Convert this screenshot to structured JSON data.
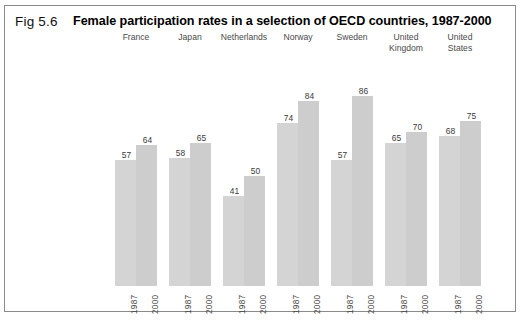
{
  "figure": {
    "number_label": "Fig 5.6",
    "title": "Female participation rates in a selection of OECD countries, 1987-2000",
    "source_note": ""
  },
  "chart_data": {
    "type": "bar",
    "title": "Female participation rates in a selection of OECD countries, 1987-2000",
    "xlabel": "",
    "ylabel": "",
    "ylim": [
      0,
      90
    ],
    "grid": false,
    "legend": "none",
    "categories": [
      "France",
      "Japan",
      "Netherlands",
      "Norway",
      "Sweden",
      "United Kingdom",
      "United States"
    ],
    "series": [
      {
        "name": "1987",
        "values": [
          57,
          58,
          41,
          74,
          57,
          65,
          68
        ]
      },
      {
        "name": "2000",
        "values": [
          64,
          65,
          50,
          84,
          86,
          70,
          75
        ]
      }
    ],
    "groups": [
      {
        "category": "France",
        "label_lines": "France",
        "bars": [
          {
            "year": "1987",
            "value": 57
          },
          {
            "year": "2000",
            "value": 64
          }
        ]
      },
      {
        "category": "Japan",
        "label_lines": "Japan",
        "bars": [
          {
            "year": "1987",
            "value": 58
          },
          {
            "year": "2000",
            "value": 65
          }
        ]
      },
      {
        "category": "Netherlands",
        "label_lines": "Netherlands",
        "bars": [
          {
            "year": "1987",
            "value": 41
          },
          {
            "year": "2000",
            "value": 50
          }
        ]
      },
      {
        "category": "Norway",
        "label_lines": "Norway",
        "bars": [
          {
            "year": "1987",
            "value": 74
          },
          {
            "year": "2000",
            "value": 84
          }
        ]
      },
      {
        "category": "Sweden",
        "label_lines": "Sweden",
        "bars": [
          {
            "year": "1987",
            "value": 57
          },
          {
            "year": "2000",
            "value": 86
          }
        ]
      },
      {
        "category": "United Kingdom",
        "label_lines": "United\nKingdom",
        "bars": [
          {
            "year": "1987",
            "value": 65
          },
          {
            "year": "2000",
            "value": 70
          }
        ]
      },
      {
        "category": "United States",
        "label_lines": "United\nStates",
        "bars": [
          {
            "year": "1987",
            "value": 68
          },
          {
            "year": "2000",
            "value": 75
          }
        ]
      }
    ],
    "colors": {
      "bar_1987": "#d4d4d4",
      "bar_2000": "#cdcdcd",
      "frame": "#8a8a8a",
      "label_text": "#3a3a3a",
      "background": "#ffffff"
    }
  }
}
